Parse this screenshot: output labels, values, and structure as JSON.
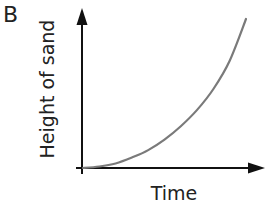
{
  "panel": {
    "label": "B"
  },
  "chart_data": {
    "type": "line",
    "title": "",
    "xlabel": "Time",
    "ylabel": "Height of sand",
    "grid": false,
    "legend": null,
    "ticks": false,
    "x": [
      0,
      0.1,
      0.2,
      0.3,
      0.4,
      0.5,
      0.6,
      0.7,
      0.8,
      0.9,
      1.0
    ],
    "series": [
      {
        "name": "Height of sand",
        "values": [
          0,
          0.01,
          0.03,
          0.07,
          0.12,
          0.19,
          0.28,
          0.39,
          0.53,
          0.72,
          1.0
        ],
        "color": "#7a7a7a",
        "shape": "increasing, accelerating (exponential-like curve)"
      }
    ],
    "xlim": [
      0,
      1.13
    ],
    "ylim": [
      0,
      1.05
    ]
  },
  "colors": {
    "axis": "#111111",
    "curve": "#7a7a7a",
    "text": "#222222"
  }
}
